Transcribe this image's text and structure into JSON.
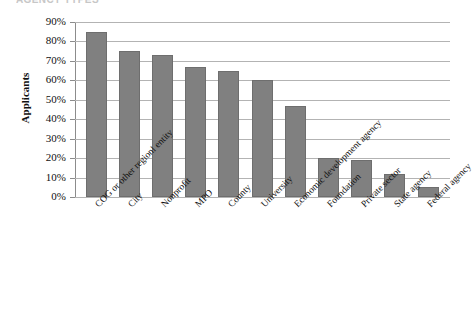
{
  "figure": {
    "title_fragment": "AGENCY TYPES",
    "background_color": "#ffffff"
  },
  "chart_data": {
    "type": "bar",
    "title": "",
    "xlabel": "",
    "ylabel": "Applicants",
    "ylim": [
      0,
      90
    ],
    "grid": true,
    "legend": "none",
    "bar_color": "#808080",
    "gridline_color": "#b3b3b3",
    "axis_color": "#8c8c8c",
    "value_suffix": "%",
    "ytick_labels": [
      "90%",
      "80%",
      "70%",
      "60%",
      "50%",
      "40%",
      "30%",
      "20%",
      "10%",
      "0%"
    ],
    "ytick_values": [
      90,
      80,
      70,
      60,
      50,
      40,
      30,
      20,
      10,
      0
    ],
    "categories": [
      "COG or other regionl entity",
      "City",
      "Nonprofit",
      "MPO",
      "County",
      "University",
      "Economic development agency",
      "Foundation",
      "Private sector",
      "State agency",
      "Federal agency"
    ],
    "values": [
      85,
      75,
      73,
      67,
      65,
      60,
      47,
      20,
      19,
      12,
      5
    ]
  }
}
